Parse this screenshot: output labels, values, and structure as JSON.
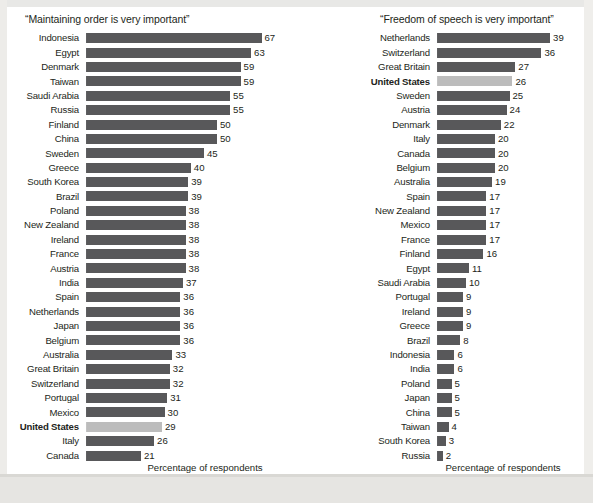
{
  "chart_data": [
    {
      "type": "bar",
      "orientation": "horizontal",
      "title": "“Maintaining order is very important”",
      "xlabel": "Percentage of respondents who value “order”",
      "xlabel_lines": [
        "Percentage of respondents",
        "who value “order”"
      ],
      "ylabel": "",
      "xlim": [
        0,
        70
      ],
      "grid": false,
      "legend": "none",
      "value_suffix": "",
      "highlight_category": "United States",
      "highlight_color": "#bcbcbc",
      "bar_color": "#58585a",
      "categories": [
        "Indonesia",
        "Egypt",
        "Denmark",
        "Taiwan",
        "Saudi Arabia",
        "Russia",
        "Finland",
        "China",
        "Sweden",
        "Greece",
        "South Korea",
        "Brazil",
        "Poland",
        "New Zealand",
        "Ireland",
        "France",
        "Austria",
        "India",
        "Spain",
        "Netherlands",
        "Japan",
        "Belgium",
        "Australia",
        "Great Britain",
        "Switzerland",
        "Portugal",
        "Mexico",
        "United States",
        "Italy",
        "Canada"
      ],
      "values": [
        67,
        63,
        59,
        59,
        55,
        55,
        50,
        50,
        45,
        40,
        39,
        39,
        38,
        38,
        38,
        38,
        38,
        37,
        36,
        36,
        36,
        36,
        33,
        32,
        32,
        31,
        30,
        29,
        26,
        21
      ]
    },
    {
      "type": "bar",
      "orientation": "horizontal",
      "title": "“Freedom of speech is very important”",
      "xlabel": "Percentage of respondents who value “freedom”",
      "xlabel_lines": [
        "Percentage of respondents",
        "who value “freedom”"
      ],
      "ylabel": "",
      "xlim": [
        0,
        40
      ],
      "grid": false,
      "legend": "none",
      "value_suffix": "",
      "highlight_category": "United States",
      "highlight_color": "#bcbcbc",
      "bar_color": "#58585a",
      "categories": [
        "Netherlands",
        "Switzerland",
        "Great Britain",
        "United States",
        "Sweden",
        "Austria",
        "Denmark",
        "Italy",
        "Canada",
        "Belgium",
        "Australia",
        "Spain",
        "New Zealand",
        "Mexico",
        "France",
        "Finland",
        "Egypt",
        "Saudi Arabia",
        "Portugal",
        "Ireland",
        "Greece",
        "Brazil",
        "Indonesia",
        "India",
        "Poland",
        "Japan",
        "China",
        "Taiwan",
        "South Korea",
        "Russia"
      ],
      "values": [
        39,
        36,
        27,
        26,
        25,
        24,
        22,
        20,
        20,
        20,
        19,
        17,
        17,
        17,
        17,
        16,
        11,
        10,
        9,
        9,
        9,
        8,
        6,
        6,
        5,
        5,
        5,
        4,
        3,
        2
      ]
    }
  ]
}
